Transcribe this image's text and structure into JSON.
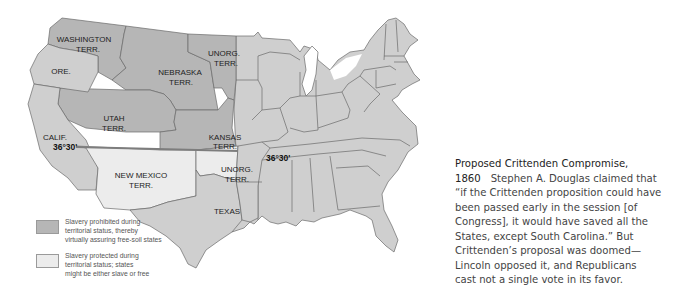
{
  "map": {
    "title": "Proposed Crittenden Compromise, 1860",
    "colors": {
      "prohibited": "#b6b6b6",
      "protected": "#ececec",
      "states": "#cfcfcf",
      "border": "#6a6a6a",
      "line_3630": "#7d7d7d"
    },
    "labels": {
      "washington_1": "WASHINGTON",
      "washington_2": "TERR.",
      "oregon": "ORE.",
      "nebraska_1": "NEBRASKA",
      "nebraska_2": "TERR.",
      "unorg_north_1": "UNORG.",
      "unorg_north_2": "TERR.",
      "utah_1": "UTAH",
      "utah_2": "TERR.",
      "kansas_1": "KANSAS",
      "kansas_2": "TERR.",
      "california": "CALIF.",
      "new_mexico_1": "NEW MEXICO",
      "new_mexico_2": "TERR.",
      "unorg_south_1": "UNORG.",
      "unorg_south_2": "TERR.",
      "texas": "TEXAS",
      "latitude_west": "36°30'",
      "latitude_east": "36°30'"
    }
  },
  "legend": [
    {
      "key": "prohibited",
      "color": "#b6b6b6",
      "lines": [
        "Slavery prohibited during",
        "territorial status, thereby",
        "virtually assuring free-soil states"
      ]
    },
    {
      "key": "protected",
      "color": "#ececec",
      "lines": [
        "Slavery protected during",
        "territorial status; states",
        "might be either slave or free"
      ]
    }
  ],
  "caption": {
    "title": "Proposed Crittenden Compromise,",
    "year": "1860",
    "lines": [
      "Stephen A. Douglas claimed that",
      "“if the Crittenden proposition could have",
      "been passed early in the session [of",
      "Congress], it would have saved all the",
      "States, except South Carolina.” But",
      "Crittenden’s proposal was doomed—",
      "Lincoln opposed it, and Republicans",
      "cast not a single vote in its favor."
    ]
  }
}
